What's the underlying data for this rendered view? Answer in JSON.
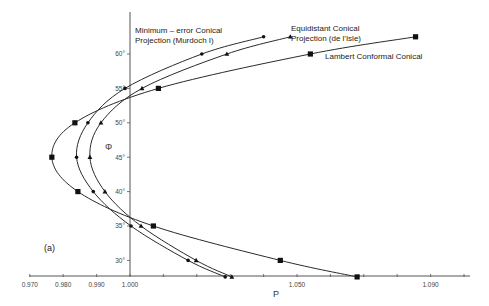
{
  "chart_data": {
    "type": "line",
    "title": "",
    "panel_label": "(a)",
    "xlabel": "P",
    "ylabel": "Φ",
    "xlim": [
      0.97,
      1.1
    ],
    "ylim": [
      27.6,
      65
    ],
    "x_ticks": [
      0.97,
      0.98,
      0.99,
      1.0,
      1.01,
      1.02,
      1.03,
      1.04,
      1.05,
      1.06,
      1.07,
      1.08,
      1.09,
      1.1
    ],
    "x_tick_labels": [
      {
        "value": 0.97,
        "label": "0.970"
      },
      {
        "value": 0.98,
        "label": "0.980"
      },
      {
        "value": 0.99,
        "label": "0.990"
      },
      {
        "value": 1.0,
        "label": "1.000"
      },
      {
        "value": 1.05,
        "label": "1.050"
      },
      {
        "value": 1.09,
        "label": "1.090"
      }
    ],
    "y_ticks": [
      {
        "value": 30,
        "label": "30°"
      },
      {
        "value": 35,
        "label": "35°"
      },
      {
        "value": 40,
        "label": "40°"
      },
      {
        "value": 45,
        "label": "45°"
      },
      {
        "value": 50,
        "label": "50°"
      },
      {
        "value": 55,
        "label": "55°"
      },
      {
        "value": 60,
        "label": "60°"
      }
    ],
    "grid": false,
    "legend": "inline annotations",
    "series": [
      {
        "name": "Minimum - error Conical Projection (Murdoch I)",
        "marker": "circle",
        "points": [
          {
            "phi": 27.6,
            "p": 1.0285
          },
          {
            "phi": 30,
            "p": 1.0174
          },
          {
            "phi": 35,
            "p": 1.0003
          },
          {
            "phi": 40,
            "p": 0.989
          },
          {
            "phi": 45,
            "p": 0.984
          },
          {
            "phi": 50,
            "p": 0.9874
          },
          {
            "phi": 55,
            "p": 0.9985
          },
          {
            "phi": 60,
            "p": 1.0215
          },
          {
            "phi": 62.5,
            "p": 1.04
          }
        ]
      },
      {
        "name": "Equidistant Conical Projection (de l'Isle)",
        "marker": "triangle",
        "points": [
          {
            "phi": 27.6,
            "p": 1.0305
          },
          {
            "phi": 30,
            "p": 1.0198
          },
          {
            "phi": 35,
            "p": 1.0033
          },
          {
            "phi": 40,
            "p": 0.9925
          },
          {
            "phi": 45,
            "p": 0.988
          },
          {
            "phi": 50,
            "p": 0.9913
          },
          {
            "phi": 55,
            "p": 1.0036
          },
          {
            "phi": 60,
            "p": 1.029
          },
          {
            "phi": 62.5,
            "p": 1.048
          }
        ]
      },
      {
        "name": "Lambert Conformal Conical",
        "marker": "square",
        "points": [
          {
            "phi": 27.6,
            "p": 1.068
          },
          {
            "phi": 30,
            "p": 1.045
          },
          {
            "phi": 35,
            "p": 1.007
          },
          {
            "phi": 40,
            "p": 0.9844
          },
          {
            "phi": 45,
            "p": 0.9766
          },
          {
            "phi": 50,
            "p": 0.9835
          },
          {
            "phi": 55,
            "p": 1.0085
          },
          {
            "phi": 60,
            "p": 1.054
          },
          {
            "phi": 62.5,
            "p": 1.0855
          }
        ]
      }
    ],
    "annotations": [
      {
        "lines": [
          "Minimum – error  Conical",
          "Projection  (Murdoch I)"
        ],
        "x": 135,
        "y": 33
      },
      {
        "lines": [
          "Equidistant  Conical",
          "Projection  (de l'Isle)"
        ],
        "x": 291,
        "y": 31
      },
      {
        "lines": [
          "Lambert  Conformal  Conical"
        ],
        "x": 325,
        "y": 59
      }
    ]
  },
  "colors": {
    "line": "#2a2a2a",
    "axis": "#555555",
    "background": "#ffffff"
  }
}
